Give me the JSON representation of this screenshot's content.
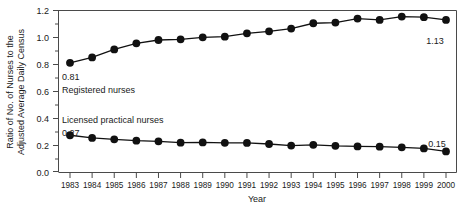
{
  "chart_data": {
    "type": "line",
    "title": "",
    "xlabel": "Year",
    "ylabel": "Ratio of No. of Nurses to the Adjusted Average Daily Census",
    "ylabel_line1": "Ratio of No. of Nurses to the",
    "ylabel_line2": "Adjusted Average Daily Census",
    "categories": [
      "1983",
      "1984",
      "1985",
      "1986",
      "1987",
      "1988",
      "1989",
      "1990",
      "1991",
      "1992",
      "1993",
      "1994",
      "1995",
      "1996",
      "1997",
      "1998",
      "1999",
      "2000"
    ],
    "x": [
      1983,
      1984,
      1985,
      1986,
      1987,
      1988,
      1989,
      1990,
      1991,
      1992,
      1993,
      1994,
      1995,
      1996,
      1997,
      1998,
      1999,
      2000
    ],
    "ylim": [
      0.0,
      1.2
    ],
    "xlim": [
      1983,
      2000
    ],
    "yticks": [
      "0.0",
      "0.2",
      "0.4",
      "0.6",
      "0.8",
      "1.0",
      "1.2"
    ],
    "ytick_values": [
      0.0,
      0.2,
      0.4,
      0.6,
      0.8,
      1.0,
      1.2
    ],
    "yminor_values": [
      0.1,
      0.3,
      0.5,
      0.7,
      0.9,
      1.1
    ],
    "grid": false,
    "legend_position": "inline-annotation",
    "series": [
      {
        "name": "Registered nurses",
        "values": [
          0.81,
          0.85,
          0.91,
          0.955,
          0.98,
          0.985,
          1.0,
          1.005,
          1.03,
          1.045,
          1.065,
          1.105,
          1.11,
          1.14,
          1.13,
          1.155,
          1.15,
          1.13
        ],
        "start_label": "0.81",
        "end_label": "1.13"
      },
      {
        "name": "Licensed practical nurses",
        "values": [
          0.27,
          0.25,
          0.24,
          0.23,
          0.225,
          0.215,
          0.217,
          0.214,
          0.213,
          0.205,
          0.193,
          0.199,
          0.191,
          0.187,
          0.185,
          0.18,
          0.172,
          0.15
        ],
        "start_label": "0.27",
        "end_label": "0.15"
      }
    ],
    "annotations": [
      {
        "text": "0.81",
        "series": "Registered nurses",
        "kind": "start-value"
      },
      {
        "text": "Registered nurses",
        "series": "Registered nurses",
        "kind": "series-label"
      },
      {
        "text": "1.13",
        "series": "Registered nurses",
        "kind": "end-value"
      },
      {
        "text": "Licensed practical nurses",
        "series": "Licensed practical nurses",
        "kind": "series-label"
      },
      {
        "text": "0.27",
        "series": "Licensed practical nurses",
        "kind": "start-value"
      },
      {
        "text": "0.15",
        "series": "Licensed practical nurses",
        "kind": "end-value"
      }
    ],
    "colors": {
      "line": "#111111",
      "marker": "#111111",
      "axis": "#4a4a4a",
      "background": "#ffffff",
      "text": "#1a1a1a"
    }
  }
}
